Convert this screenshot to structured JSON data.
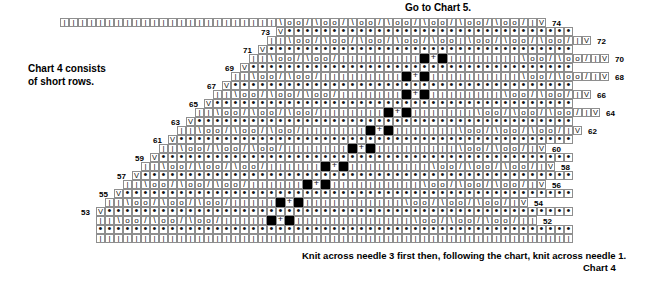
{
  "header": {
    "goto_chart": "Go to Chart 5."
  },
  "notes": {
    "left_note": "Chart 4 consists\nof short rows.",
    "bottom_note": "Knit across needle 3 first then, following the chart, knit across needle 1.",
    "chart_label": "Chart 4"
  },
  "legend_symbols": {
    "knit": "|",
    "purl": "•",
    "yarn_over": "o",
    "k2tog": "/",
    "ssk": "\\",
    "slip": "V",
    "cross": "+",
    "no_stitch": "■"
  },
  "grid": {
    "cell_size": 9,
    "origin_x": 60,
    "origin_y": 18,
    "columns": 58,
    "rows": 24
  },
  "chart_data": {
    "type": "table",
    "title": "Chart 4",
    "row_labels_left": [
      73,
      71,
      69,
      67,
      65,
      63,
      61,
      59,
      57,
      55,
      53
    ],
    "row_labels_right": [
      74,
      72,
      70,
      68,
      66,
      64,
      62,
      60,
      58,
      56,
      54,
      52
    ],
    "rows": [
      {
        "num": 74,
        "label_side": "right",
        "start": 0,
        "cells": "||||||||||||||||||||||||\\oo/\\oo/\\oo/\\oo/\\oo/\\oo/\\oo/|V"
      },
      {
        "num": 73,
        "label_side": "left",
        "start": 24,
        "cells": "V••••••••••••••••••••••••••••••••"
      },
      {
        "num": 72,
        "label_side": "right",
        "start": 23,
        "cells": "||\\oo/\\oo/\\oo/\\oo/\\oo|\\oo/\\oo/\\oo/|V"
      },
      {
        "num": 71,
        "label_side": "left",
        "start": 22,
        "cells": "V••••••••••••••••••••••••••••••••••"
      },
      {
        "num": 70,
        "label_side": "right",
        "start": 21,
        "cells": "||\\oo/\\oo/|||||||||■+■||||||||\\oo/\\oo/|V"
      },
      {
        "num": 69,
        "label_side": "left",
        "start": 20,
        "cells": "V••••••••••••••••••••••••••••••••••••"
      },
      {
        "num": 68,
        "label_side": "right",
        "start": 19,
        "cells": "||\\oo/\\oo/|||||||||■+■||||||||||\\oo/\\oo/|V"
      },
      {
        "num": 67,
        "label_side": "left",
        "start": 18,
        "cells": "V••••••••••••••••••••••••••••••••••••••"
      },
      {
        "num": 66,
        "label_side": "right",
        "start": 17,
        "cells": "||\\oo/\\oo/\\oo/|||||||■+■||||||||\\oo/\\oo/|V"
      },
      {
        "num": 65,
        "label_side": "left",
        "start": 16,
        "cells": "V••••••••••••••••••••••••••••••••••••••••"
      },
      {
        "num": 64,
        "label_side": "right",
        "start": 15,
        "cells": "||\\oo/\\oo/\\oo/|||||||■+■|||||||\\oo/\\oo/\\oo/|V"
      },
      {
        "num": 63,
        "label_side": "left",
        "start": 14,
        "cells": "V••••••••••••••••••••••••••••••••••••••••••"
      },
      {
        "num": 62,
        "label_side": "right",
        "start": 13,
        "cells": "||\\oo/\\oo/\\oo/|||||||■+■|||||||\\oo/\\oo/\\oo/|V"
      },
      {
        "num": 61,
        "label_side": "left",
        "start": 12,
        "cells": "V••••••••••••••••••••••••••••••••••••••••••••"
      },
      {
        "num": 60,
        "label_side": "right",
        "start": 11,
        "cells": "||\\oo/\\oo/\\oo/|||||||■+■|||||||||\\oo/\\oo/|V"
      },
      {
        "num": 59,
        "label_side": "left",
        "start": 10,
        "cells": "V••••••••••••••••••••••••••••••••••••••••••••••"
      },
      {
        "num": 58,
        "label_side": "right",
        "start": 9,
        "cells": "||\\oo/\\oo/\\oo/||||||■+■|||||||||\\oo/\\oo/\\oo/|V"
      },
      {
        "num": 57,
        "label_side": "left",
        "start": 8,
        "cells": "V••••••••••••••••••••••••••••••••••••••••••••••••"
      },
      {
        "num": 56,
        "label_side": "right",
        "start": 7,
        "cells": "||\\oo/\\oo/\\oo/||||||■+■||||||||||\\oo/\\oo/\\oo/|V"
      },
      {
        "num": 55,
        "label_side": "left",
        "start": 6,
        "cells": "V••••••••••••••••••••••••••••••••••••••••••••••••••"
      },
      {
        "num": 54,
        "label_side": "right",
        "start": 5,
        "cells": "||\\oo/\\oo/\\oo/|||||■+■|||||||||||\\oo/\\oo/\\oo/|V"
      },
      {
        "num": 53,
        "label_side": "left",
        "start": 4,
        "cells": "V••••••••••••••••••••••••••••••••••••••••••••••••••••"
      },
      {
        "num": 52,
        "label_side": "right",
        "start": 4,
        "cells": "||\\oo/\\oo/\\oo/|||||■+■|||||||||||||\\oo/\\oo/\\oo/||"
      },
      {
        "num": null,
        "label_side": "none",
        "start": 4,
        "cells": "•••••••••••••••••••••••••••••••••••••••••••••••••••••"
      },
      {
        "num": null,
        "label_side": "none",
        "start": 4,
        "cells": "|||||||||||||||||||||||||||||||||||||||||||||||||||||"
      }
    ]
  }
}
